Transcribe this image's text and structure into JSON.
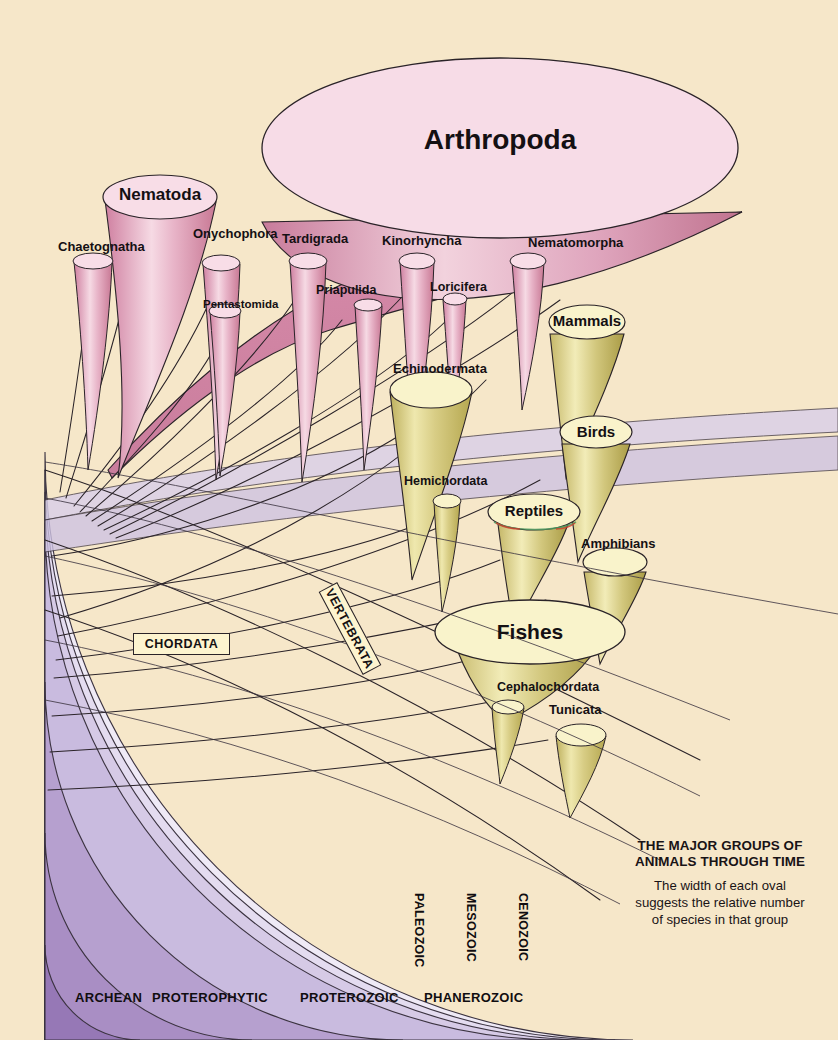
{
  "figure": {
    "background_color": "#f6e7c9",
    "caption_title_line1": "THE MAJOR GROUPS OF",
    "caption_title_line2": "ANIMALS THROUGH TIME",
    "caption_body_line1": "The width of each oval",
    "caption_body_line2": "suggests the relative number",
    "caption_body_line3": "of species in that group"
  },
  "palette": {
    "background": "#f6e7c9",
    "arthropoda_fill": "#f7dce7",
    "invert_cone_light": "#f3c9d6",
    "invert_cone_dark": "#cf7e9e",
    "invert_wedge": "#d085a6",
    "chordate_oval_fill": "#f9f3cb",
    "chordate_cone_light": "#ded58f",
    "chordate_cone_dark": "#bfb055",
    "outline": "#2a2328",
    "era_archean": "#8d6fae",
    "era_proterophytic": "#a98ec4",
    "era_proterozoic": "#c4b4da",
    "era_paleozoic": "#d6cae6",
    "era_mesozoic": "#e2daee",
    "era_cenozoic": "#ece7f4",
    "box_fill": "#fdf4cf"
  },
  "groups": {
    "invertebrates": [
      {
        "name": "Arthropoda",
        "label": "Arthropoda",
        "size": "largest"
      },
      {
        "name": "Nematoda",
        "label": "Nematoda",
        "size": "large"
      },
      {
        "name": "Chaetognatha",
        "label": "Chaetognatha",
        "size": "small"
      },
      {
        "name": "Onychophora",
        "label": "Onychophora",
        "size": "small"
      },
      {
        "name": "Pentastomida",
        "label": "Pentastomida",
        "size": "small"
      },
      {
        "name": "Tardigrada",
        "label": "Tardigrada",
        "size": "small"
      },
      {
        "name": "Priapulida",
        "label": "Priapulida",
        "size": "tiny"
      },
      {
        "name": "Kinorhyncha",
        "label": "Kinorhyncha",
        "size": "small"
      },
      {
        "name": "Loricifera",
        "label": "Loricifera",
        "size": "tiny"
      },
      {
        "name": "Nematomorpha",
        "label": "Nematomorpha",
        "size": "small"
      }
    ],
    "deuterostomes": [
      {
        "name": "Echinodermata",
        "label": "Echinodermata",
        "size": "large"
      },
      {
        "name": "Hemichordata",
        "label": "Hemichordata",
        "size": "tiny"
      },
      {
        "name": "Mammals",
        "label": "Mammals",
        "size": "medium"
      },
      {
        "name": "Birds",
        "label": "Birds",
        "size": "medium"
      },
      {
        "name": "Reptiles",
        "label": "Reptiles",
        "size": "medium"
      },
      {
        "name": "Amphibians",
        "label": "Amphibians",
        "size": "small"
      },
      {
        "name": "Fishes",
        "label": "Fishes",
        "size": "large"
      },
      {
        "name": "Cephalochordata",
        "label": "Cephalochordata",
        "size": "tiny"
      },
      {
        "name": "Tunicata",
        "label": "Tunicata",
        "size": "small"
      }
    ]
  },
  "clade_boxes": [
    {
      "id": "chordata",
      "label": "CHORDATA"
    },
    {
      "id": "vertebrata",
      "label": "VERTEBRATA"
    }
  ],
  "time_scale": {
    "eons": [
      {
        "label": "ARCHEAN",
        "color": "#a98ec4",
        "orientation": "horizontal"
      },
      {
        "label": "PROTEROPHYTIC",
        "color": "#b6a0cf",
        "orientation": "horizontal"
      },
      {
        "label": "PROTEROZOIC",
        "color": "#c9bbdf",
        "orientation": "horizontal"
      },
      {
        "label": "PHANEROZOIC",
        "color": "#ded6ec",
        "orientation": "horizontal"
      }
    ],
    "eras": [
      {
        "label": "PALEOZOIC",
        "color": "#d6cae6",
        "orientation": "vertical"
      },
      {
        "label": "MESOZOIC",
        "color": "#e4dcf0",
        "orientation": "vertical"
      },
      {
        "label": "CENOZOIC",
        "color": "#efeaf6",
        "orientation": "vertical"
      }
    ]
  }
}
